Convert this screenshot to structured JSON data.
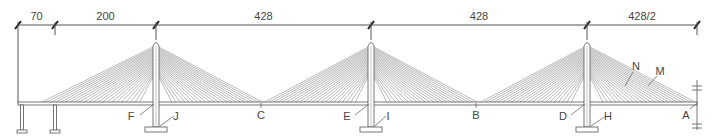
{
  "diagram": {
    "type": "cable-stayed bridge elevation",
    "colors": {
      "line": "#555555",
      "cable": "#8a8a8a",
      "text": "#444444",
      "background": "#ffffff"
    },
    "dimensions": [
      {
        "label": "70",
        "x1": 18,
        "x2": 55
      },
      {
        "label": "200",
        "x1": 55,
        "x2": 156
      },
      {
        "label": "428",
        "x1": 156,
        "x2": 371
      },
      {
        "label": "428",
        "x1": 371,
        "x2": 587
      },
      {
        "label": "428/2",
        "x1": 587,
        "x2": 697
      }
    ],
    "towers": [
      {
        "id": "tower-1",
        "x": 156
      },
      {
        "id": "tower-2",
        "x": 371
      },
      {
        "id": "tower-3",
        "x": 587
      }
    ],
    "labels": [
      {
        "text": "A",
        "x": 686,
        "y": 119
      },
      {
        "text": "B",
        "x": 476,
        "y": 119
      },
      {
        "text": "C",
        "x": 261,
        "y": 119
      },
      {
        "text": "D",
        "x": 563,
        "y": 120
      },
      {
        "text": "E",
        "x": 347,
        "y": 120
      },
      {
        "text": "F",
        "x": 131,
        "y": 120
      },
      {
        "text": "H",
        "x": 608,
        "y": 120
      },
      {
        "text": "I",
        "x": 388,
        "y": 120
      },
      {
        "text": "J",
        "x": 176,
        "y": 120
      },
      {
        "text": "N",
        "x": 636,
        "y": 70
      },
      {
        "text": "M",
        "x": 660,
        "y": 75
      }
    ]
  }
}
